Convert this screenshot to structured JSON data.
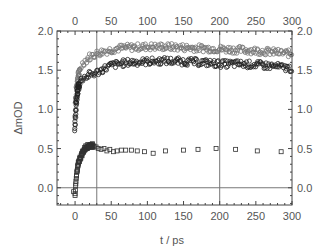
{
  "chart_data": {
    "type": "scatter",
    "title": "",
    "xlabel": "t / ps",
    "ylabel": "ΔmOD",
    "xlim": [
      -25,
      300
    ],
    "ylim": [
      -0.22,
      2.0
    ],
    "x_ticks": [
      0,
      50,
      100,
      150,
      200,
      250,
      300
    ],
    "y_ticks": [
      0.0,
      0.5,
      1.0,
      1.5,
      2.0
    ],
    "x_tick_labels": [
      "0",
      "50",
      "100",
      "150",
      "200",
      "250",
      "300"
    ],
    "y_tick_labels": [
      "0.0",
      "0.5",
      "1.0",
      "1.5",
      "2.0"
    ],
    "mirror_axes": true,
    "grid": false,
    "reference_lines": {
      "horizontal": [
        0.0
      ],
      "vertical": [
        30,
        200
      ]
    },
    "series": [
      {
        "name": "upper-circles",
        "marker": "circle",
        "color": "#777777",
        "x": [
          0,
          1,
          2,
          3,
          4,
          5,
          7,
          10,
          15,
          20,
          25,
          30,
          40,
          50,
          60,
          75,
          100,
          125,
          150,
          175,
          200,
          225,
          250,
          275,
          300
        ],
        "y": [
          0.8,
          1.1,
          1.25,
          1.33,
          1.4,
          1.45,
          1.52,
          1.58,
          1.63,
          1.67,
          1.69,
          1.71,
          1.74,
          1.76,
          1.78,
          1.79,
          1.8,
          1.8,
          1.79,
          1.78,
          1.77,
          1.76,
          1.75,
          1.73,
          1.71
        ]
      },
      {
        "name": "lower-circles",
        "marker": "circle",
        "color": "#222222",
        "x": [
          0,
          1,
          2,
          3,
          4,
          5,
          7,
          10,
          15,
          20,
          25,
          30,
          40,
          50,
          60,
          75,
          100,
          125,
          150,
          175,
          200,
          225,
          250,
          275,
          300
        ],
        "y": [
          0.75,
          1.0,
          1.12,
          1.2,
          1.26,
          1.3,
          1.35,
          1.39,
          1.42,
          1.44,
          1.45,
          1.47,
          1.52,
          1.56,
          1.58,
          1.6,
          1.61,
          1.62,
          1.61,
          1.6,
          1.58,
          1.58,
          1.57,
          1.55,
          1.52
        ]
      },
      {
        "name": "squares",
        "marker": "square",
        "color": "#333333",
        "x": [
          -2,
          0,
          1,
          2,
          3,
          4,
          5,
          7,
          9,
          11,
          13,
          15,
          18,
          20,
          23,
          26,
          29,
          32,
          36,
          40,
          44,
          48,
          53,
          58,
          64,
          70,
          78,
          86,
          96,
          108,
          125,
          150,
          170,
          195,
          222,
          252,
          285
        ],
        "y": [
          -0.05,
          -0.1,
          0.05,
          0.15,
          0.22,
          0.28,
          0.33,
          0.38,
          0.42,
          0.46,
          0.49,
          0.52,
          0.53,
          0.54,
          0.54,
          0.53,
          0.52,
          0.5,
          0.49,
          0.5,
          0.47,
          0.49,
          0.46,
          0.47,
          0.48,
          0.48,
          0.48,
          0.47,
          0.46,
          0.44,
          0.47,
          0.48,
          0.49,
          0.5,
          0.49,
          0.47,
          0.46
        ]
      }
    ]
  }
}
